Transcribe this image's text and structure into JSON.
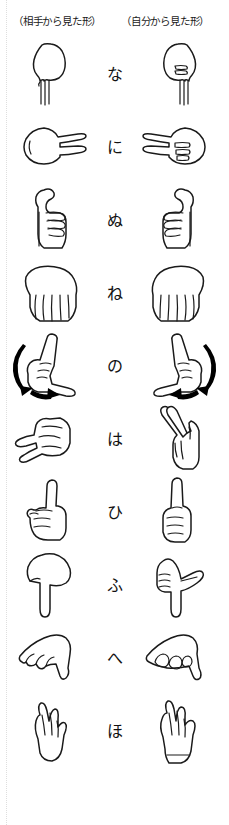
{
  "chart": {
    "title_left": "（相手から見た形）",
    "title_right": "（自分から見た形）",
    "kind": "japanese-fingerspelling-chart",
    "column_count": 2,
    "row_count": 10
  },
  "rows": [
    {
      "kana": "な",
      "romaji": "na",
      "shape": "na",
      "motion": false
    },
    {
      "kana": "に",
      "romaji": "ni",
      "shape": "ni",
      "motion": false
    },
    {
      "kana": "ぬ",
      "romaji": "nu",
      "shape": "nu",
      "motion": false
    },
    {
      "kana": "ね",
      "romaji": "ne",
      "shape": "ne",
      "motion": false
    },
    {
      "kana": "の",
      "romaji": "no",
      "shape": "no",
      "motion": true
    },
    {
      "kana": "は",
      "romaji": "ha",
      "shape": "ha",
      "motion": false
    },
    {
      "kana": "ひ",
      "romaji": "hi",
      "shape": "hi",
      "motion": false
    },
    {
      "kana": "ふ",
      "romaji": "fu",
      "shape": "fu",
      "motion": false
    },
    {
      "kana": "へ",
      "romaji": "he",
      "shape": "he",
      "motion": false
    },
    {
      "kana": "ほ",
      "romaji": "ho",
      "shape": "ho",
      "motion": false
    }
  ],
  "colors": {
    "ink": "#1a1a1a",
    "paper": "#ffffff",
    "arrow": "#000000",
    "guide": "#dedede"
  }
}
